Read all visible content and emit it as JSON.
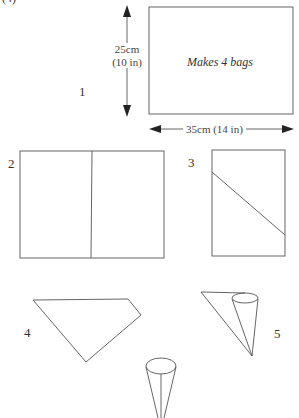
{
  "header": {
    "partial_text": "(4)"
  },
  "steps": [
    {
      "number": "1",
      "note": "Makes 4 bags",
      "height_label_cm": "25cm",
      "height_label_in": "(10 in)",
      "width_label": "35cm (14 in)"
    },
    {
      "number": "2"
    },
    {
      "number": "3"
    },
    {
      "number": "4"
    },
    {
      "number": "5"
    }
  ],
  "colors": {
    "line": "#555555",
    "background": "#ffffff"
  }
}
